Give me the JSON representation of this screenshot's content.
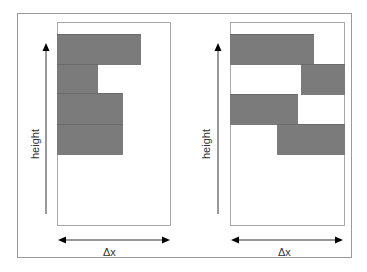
{
  "diagram": {
    "panels": [
      {
        "id": "left",
        "y_axis_label": "height",
        "x_axis_label": "Δx",
        "blocks": [
          {
            "row": 1,
            "x_start": 0.0,
            "x_end": 0.73
          },
          {
            "row": 2,
            "x_start": 0.0,
            "x_end": 0.36
          },
          {
            "row": 3,
            "x_start": 0.0,
            "x_end": 0.58
          },
          {
            "row": 4,
            "x_start": 0.0,
            "x_end": 0.58
          }
        ]
      },
      {
        "id": "right",
        "y_axis_label": "height",
        "x_axis_label": "Δx",
        "blocks": [
          {
            "row": 1,
            "x_start": 0.0,
            "x_end": 0.74
          },
          {
            "row": 2,
            "x_start": 0.62,
            "x_end": 1.0
          },
          {
            "row": 3,
            "x_start": 0.0,
            "x_end": 0.6
          },
          {
            "row": 4,
            "x_start": 0.41,
            "x_end": 1.0
          }
        ]
      }
    ],
    "colors": {
      "block_fill": "#7b7b7b",
      "frame_border": "#9a9a9a",
      "arrow": "#000000"
    }
  }
}
